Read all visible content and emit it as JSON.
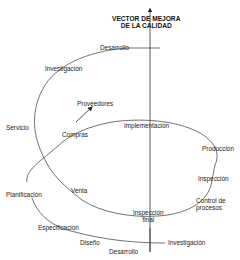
{
  "title": {
    "line1": "VECTOR DE MEJORA",
    "line2": "DE LA CALIDAD"
  },
  "upper_spiral": {
    "labels": [
      "Desarrollo",
      "Investigación",
      "Servicio",
      "Compras",
      "Proveedores",
      "Venta"
    ]
  },
  "lower_cycle": {
    "labels": [
      "Implementación",
      "Producción",
      "Inspección",
      "Control de",
      "procesos",
      "Inspección",
      "final"
    ]
  },
  "bottom_spiral": {
    "labels": [
      "Planificación",
      "Especificación",
      "Diseño",
      "Desarrollo",
      "Investigación"
    ]
  },
  "colors": {
    "line": "#333333",
    "text": "#222222"
  }
}
